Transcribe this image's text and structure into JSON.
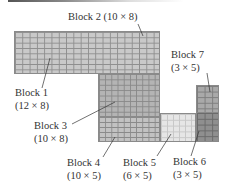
{
  "diagram": {
    "type": "block-layout",
    "blocks": [
      {
        "id": "block1",
        "name": "Block 1",
        "dims": "(12 × 8)",
        "cols": 12,
        "rows": 8,
        "color": "#c9c9c9"
      },
      {
        "id": "block2",
        "name": "Block 2 (10 × 8)",
        "dims": "(10 × 8)",
        "cols": 10,
        "rows": 8,
        "color": "#c9c9c9"
      },
      {
        "id": "block3",
        "name": "Block 3",
        "dims": "(10 × 8)",
        "cols": 10,
        "rows": 8,
        "color": "#b4b4b4"
      },
      {
        "id": "block4",
        "name": "Block 4",
        "dims": "(10 × 5)",
        "cols": 10,
        "rows": 5,
        "color": "#c2c2c2"
      },
      {
        "id": "block5",
        "name": "Block 5",
        "dims": "(6 × 5)",
        "cols": 6,
        "rows": 5,
        "color": "#e6e6e6"
      },
      {
        "id": "block6",
        "name": "Block 6",
        "dims": "(3 × 5)",
        "cols": 3,
        "rows": 5,
        "color": "#8f8f8f"
      },
      {
        "id": "block7",
        "name": "Block 7",
        "dims": "(3 × 5)",
        "cols": 3,
        "rows": 5,
        "color": "#a9a9a9"
      }
    ]
  }
}
